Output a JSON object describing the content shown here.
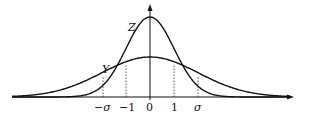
{
  "chart_data": {
    "type": "line",
    "title": "",
    "xlabel": "",
    "ylabel": "",
    "series": [
      {
        "name": "Z",
        "description": "standard normal density, sigma = 1 (taller, narrower)",
        "sigma": 1
      },
      {
        "name": "Y",
        "description": "normal density with sigma > 1 (flatter, wider)",
        "sigma": "σ"
      }
    ],
    "x_ticks": [
      "−σ",
      "−1",
      "0",
      "1",
      "σ"
    ],
    "annotations": [
      "dotted vertical guides at x = −σ, −1, 1, σ",
      "curves intersect near x = ±1"
    ],
    "grid": false,
    "legend": "curve labels Z and Y placed next to curves"
  },
  "labels": {
    "curve_z": "Z",
    "curve_y": "Y",
    "tick_neg_sigma": "−σ",
    "tick_neg_one": "−1",
    "tick_zero": "0",
    "tick_one": "1",
    "tick_sigma": "σ"
  }
}
